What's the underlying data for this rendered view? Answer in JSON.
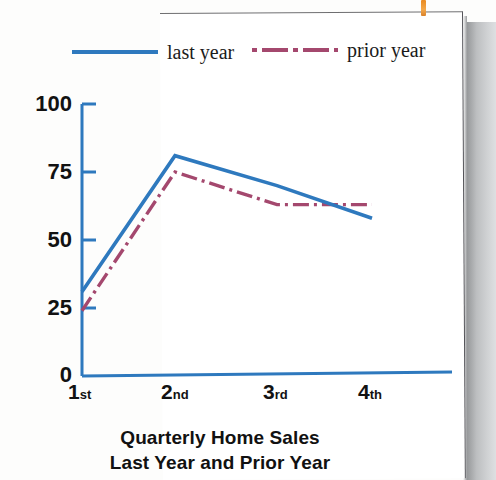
{
  "page": {
    "bookmark_color": "#e98a20",
    "sheet_border_color": "#55555a"
  },
  "legend": {
    "position": "top",
    "entries": [
      {
        "label": "last year",
        "color": "#2e79be",
        "style": "solid"
      },
      {
        "label": "prior year",
        "color": "#a4486e",
        "style": "dash-dot"
      }
    ]
  },
  "axes": {
    "y_ticks": [
      "100",
      "75",
      "50",
      "25",
      "0"
    ],
    "x_ticks": [
      {
        "num": "1",
        "suffix": "st"
      },
      {
        "num": "2",
        "suffix": "nd"
      },
      {
        "num": "3",
        "suffix": "rd"
      },
      {
        "num": "4",
        "suffix": "th"
      }
    ],
    "axis_color": "#2e79be"
  },
  "title": {
    "line1": "Quarterly Home Sales",
    "line2": "Last Year and Prior Year"
  },
  "chart_data": {
    "type": "line",
    "title": "Quarterly Home Sales Last Year and Prior Year",
    "xlabel": "",
    "ylabel": "",
    "categories": [
      "1st",
      "2nd",
      "3rd",
      "4th"
    ],
    "series": [
      {
        "name": "last year",
        "color": "#2e79be",
        "style": "solid",
        "values": [
          31,
          81,
          70,
          58
        ]
      },
      {
        "name": "prior year",
        "color": "#a4486e",
        "style": "dash-dot",
        "values": [
          24,
          75,
          63,
          63
        ]
      }
    ],
    "ylim": [
      0,
      100
    ],
    "yticks": [
      0,
      25,
      50,
      75,
      100
    ],
    "grid": false,
    "legend_position": "top"
  }
}
